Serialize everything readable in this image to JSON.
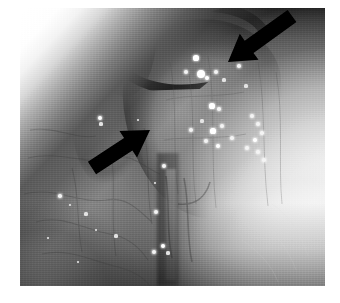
{
  "figure": {
    "kind": "endoscopic-photograph",
    "modality": "flexible laryngoscopy / endoscopy",
    "color_mode": "grayscale",
    "caption": "",
    "title": "",
    "page_background": "#ffffff",
    "photo": {
      "x": 20,
      "y": 8,
      "width": 305,
      "height": 278,
      "tone_min": "#101010",
      "tone_max": "#ffffff",
      "base_tone": "#7a7a7a",
      "highlight_tone": "#ffffff",
      "shadow_tone": "#141414",
      "description": "Midline endoscopic view of mucosal surfaces; a pale rounded mass occupies the right of centre with numerous bright specular highlights (secretions) over its surface; a dark curved crevice runs across the upper portion; a dark vertical midline cleft descends from the centre to the lower border; the lower-right quadrant is overexposed and near-white; the upper-left corner carries a bright diagonal glare band."
    },
    "annotations": [
      {
        "name": "arrow-upper-right",
        "type": "arrow",
        "color": "#000000",
        "tail": {
          "x": 292,
          "y": 16
        },
        "tip": {
          "x": 228,
          "y": 62
        },
        "direction": "down-left",
        "label": ""
      },
      {
        "name": "arrow-left",
        "type": "arrow",
        "color": "#000000",
        "tail": {
          "x": 92,
          "y": 168
        },
        "tip": {
          "x": 150,
          "y": 130
        },
        "direction": "up-right",
        "label": ""
      }
    ],
    "specular_highlights": [
      {
        "x": 196,
        "y": 58,
        "r": 2.6
      },
      {
        "x": 186,
        "y": 72,
        "r": 2.0
      },
      {
        "x": 201,
        "y": 74,
        "r": 4.2
      },
      {
        "x": 207,
        "y": 78,
        "r": 2.4
      },
      {
        "x": 216,
        "y": 72,
        "r": 2.0
      },
      {
        "x": 224,
        "y": 80,
        "r": 1.6
      },
      {
        "x": 239,
        "y": 66,
        "r": 1.8
      },
      {
        "x": 246,
        "y": 86,
        "r": 1.6
      },
      {
        "x": 212,
        "y": 106,
        "r": 2.6
      },
      {
        "x": 219,
        "y": 109,
        "r": 1.8
      },
      {
        "x": 202,
        "y": 121,
        "r": 1.6
      },
      {
        "x": 191,
        "y": 130,
        "r": 2.0
      },
      {
        "x": 213,
        "y": 131,
        "r": 2.6
      },
      {
        "x": 222,
        "y": 126,
        "r": 2.2
      },
      {
        "x": 206,
        "y": 141,
        "r": 2.0
      },
      {
        "x": 218,
        "y": 146,
        "r": 2.4
      },
      {
        "x": 232,
        "y": 138,
        "r": 1.8
      },
      {
        "x": 252,
        "y": 116,
        "r": 2.2
      },
      {
        "x": 258,
        "y": 124,
        "r": 2.0
      },
      {
        "x": 262,
        "y": 133,
        "r": 1.8
      },
      {
        "x": 255,
        "y": 140,
        "r": 2.4
      },
      {
        "x": 247,
        "y": 148,
        "r": 2.0
      },
      {
        "x": 258,
        "y": 152,
        "r": 2.2
      },
      {
        "x": 264,
        "y": 160,
        "r": 1.8
      },
      {
        "x": 100,
        "y": 118,
        "r": 2.4
      },
      {
        "x": 101,
        "y": 124,
        "r": 1.6
      },
      {
        "x": 138,
        "y": 120,
        "r": 1.4
      },
      {
        "x": 164,
        "y": 166,
        "r": 2.0
      },
      {
        "x": 155,
        "y": 183,
        "r": 1.4
      },
      {
        "x": 156,
        "y": 212,
        "r": 2.0
      },
      {
        "x": 163,
        "y": 246,
        "r": 2.4
      },
      {
        "x": 154,
        "y": 252,
        "r": 2.0
      },
      {
        "x": 168,
        "y": 253,
        "r": 1.6
      },
      {
        "x": 60,
        "y": 196,
        "r": 1.8
      },
      {
        "x": 70,
        "y": 205,
        "r": 1.4
      },
      {
        "x": 86,
        "y": 214,
        "r": 1.6
      },
      {
        "x": 96,
        "y": 230,
        "r": 1.4
      },
      {
        "x": 48,
        "y": 238,
        "r": 1.4
      },
      {
        "x": 78,
        "y": 262,
        "r": 1.4
      },
      {
        "x": 116,
        "y": 236,
        "r": 1.6
      }
    ]
  }
}
